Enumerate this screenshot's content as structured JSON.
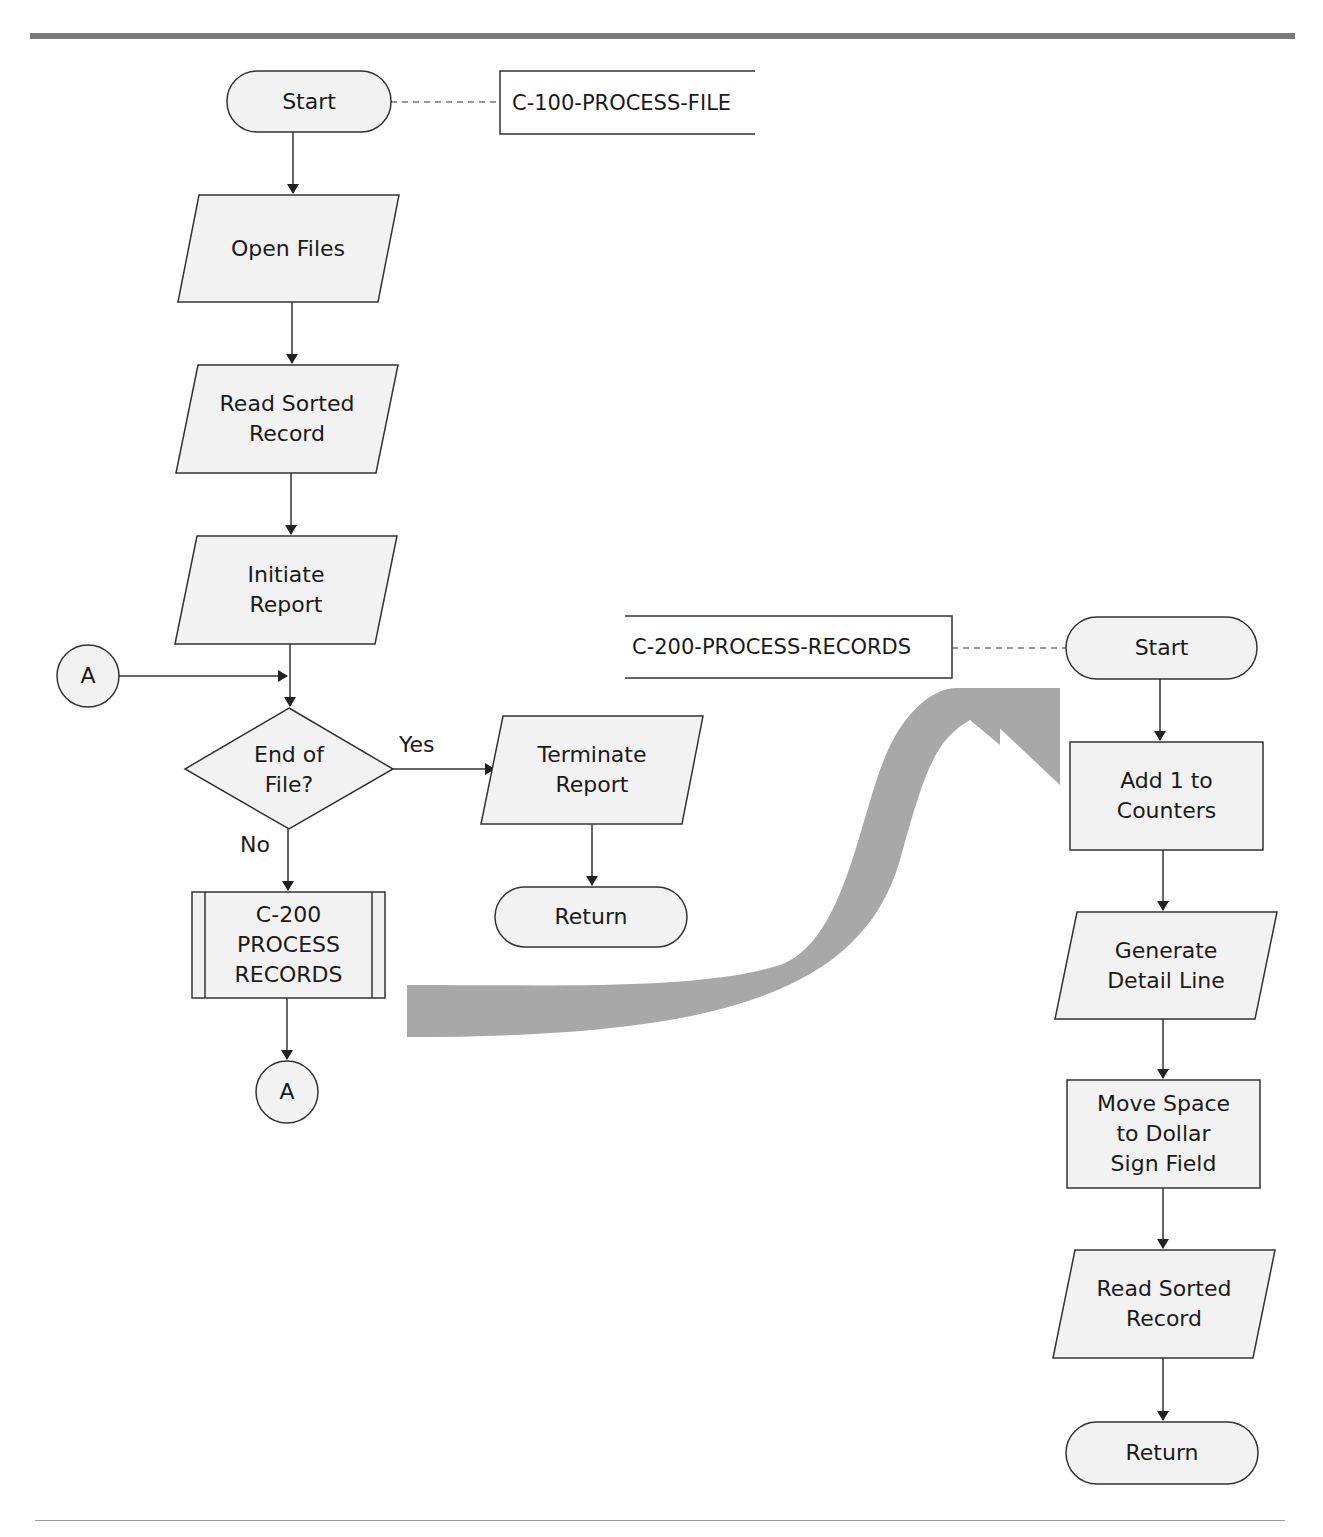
{
  "diagram": {
    "left_flow": {
      "module_label": "C-100-PROCESS-FILE",
      "start": "Start",
      "open_files": "Open Files",
      "read_sorted_record": "Read Sorted\nRecord",
      "initiate_report": "Initiate\nReport",
      "connector_in": "A",
      "decision": "End of\nFile?",
      "yes_label": "Yes",
      "no_label": "No",
      "terminate_report": "Terminate\nReport",
      "return": "Return",
      "subprocess": "C-200\nPROCESS\nRECORDS",
      "connector_out": "A"
    },
    "right_flow": {
      "module_label": "C-200-PROCESS-RECORDS",
      "start": "Start",
      "add_counters": "Add 1 to\nCounters",
      "generate_detail": "Generate\nDetail Line",
      "move_space": "Move Space\nto Dollar\nSign Field",
      "read_sorted_record": "Read Sorted\nRecord",
      "return": "Return"
    },
    "colors": {
      "shape_fill": "#f2f2f2",
      "stroke": "#333333",
      "big_arrow": "#a8a8a8",
      "rule": "#7a7a7a"
    }
  }
}
